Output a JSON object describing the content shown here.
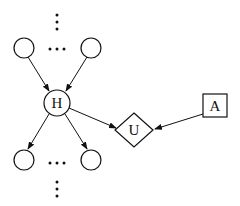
{
  "diagram": {
    "type": "influence-diagram",
    "nodes": [
      {
        "id": "parent-left",
        "shape": "circle",
        "label": ""
      },
      {
        "id": "parent-right",
        "shape": "circle",
        "label": ""
      },
      {
        "id": "H",
        "shape": "circle",
        "label": "H"
      },
      {
        "id": "child-left",
        "shape": "circle",
        "label": ""
      },
      {
        "id": "child-right",
        "shape": "circle",
        "label": ""
      },
      {
        "id": "U",
        "shape": "diamond",
        "label": "U"
      },
      {
        "id": "A",
        "shape": "square",
        "label": "A"
      }
    ],
    "edges": [
      {
        "from": "parent-left",
        "to": "H"
      },
      {
        "from": "parent-right",
        "to": "H"
      },
      {
        "from": "H",
        "to": "child-left"
      },
      {
        "from": "H",
        "to": "child-right"
      },
      {
        "from": "H",
        "to": "U"
      },
      {
        "from": "A",
        "to": "U"
      }
    ],
    "ellipses": {
      "top_vertical": "⋮",
      "parents_horizontal": "…",
      "children_horizontal": "…",
      "bottom_vertical": "⋮"
    },
    "colors": {
      "stroke": "#111111",
      "background": "#ffffff"
    }
  }
}
